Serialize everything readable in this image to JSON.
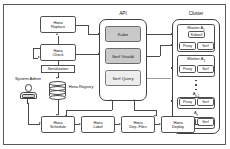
{
  "diagram": {
    "colors": {
      "border": "#4a4a4a",
      "service_fill": "#c9c9c9",
      "service_fill_light": "#ededed",
      "background": "#ffffff"
    }
  },
  "actor": {
    "label": "System Admin",
    "icon": "user-actor-icon"
  },
  "left_column": {
    "replace": {
      "line1": "Hona",
      "line2": "Replace"
    },
    "check": {
      "line1": "Hona",
      "line2": "Check"
    },
    "serialization_label": "Serialization",
    "registry": {
      "line1": "Hona",
      "line2": "Registry"
    },
    "registry_icon": "database-cylinder-icon"
  },
  "api_panel": {
    "title": "API",
    "services": [
      {
        "label": "Kube",
        "shade": "dark"
      },
      {
        "label": "Serf Vivaldi",
        "shade": "dark"
      },
      {
        "label": "Serf Query",
        "shade": "light"
      }
    ]
  },
  "cluster_panel": {
    "title": "Cluster",
    "groups": [
      {
        "name": "Master",
        "subscript": "A1",
        "label_prefix": "Master",
        "label_var": "A",
        "label_sub": "1",
        "top_node": "Kubectl",
        "nodes": [
          "Proxy",
          "Serf"
        ]
      },
      {
        "name": "Worker",
        "label_prefix": "Worker",
        "label_var": "A",
        "label_sub": "2",
        "nodes": [
          "Proxy",
          "Serf"
        ]
      },
      {
        "name": "N-1",
        "label_prefix": "",
        "label_var": "A",
        "label_sub": "n-1",
        "nodes": [
          "Proxy",
          "Serf"
        ]
      },
      {
        "name": "N",
        "label_prefix": "",
        "label_var": "A",
        "label_sub": "n",
        "nodes": [
          "Proxy",
          "Serf"
        ]
      }
    ],
    "ellipsis": "vertical-dots"
  },
  "bottom_row": [
    {
      "line1": "Hona",
      "line2": "Schedule"
    },
    {
      "line1": "Hona",
      "line2": "Label"
    },
    {
      "line1": "Hona",
      "line2": "Dep. Files"
    },
    {
      "line1": "Hona",
      "line2": "Deploy"
    }
  ]
}
